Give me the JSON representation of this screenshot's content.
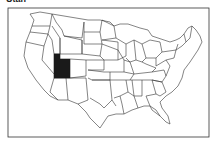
{
  "title": "Utah",
  "map": {
    "region": "United States",
    "highlighted_state": "Utah",
    "highlight_color": "#1a1a1a",
    "border_color": "#333333",
    "background": "#ffffff"
  }
}
